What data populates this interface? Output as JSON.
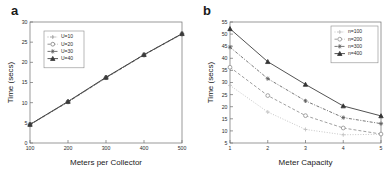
{
  "figure": {
    "panel_a_label": "a",
    "panel_b_label": "b"
  },
  "chart_data": [
    {
      "panel": "a",
      "type": "line",
      "title": "",
      "xlabel": "Meters per Collector",
      "ylabel": "Time (secs)",
      "x": [
        100,
        200,
        300,
        400,
        500
      ],
      "xticks": [
        "100",
        "200",
        "300",
        "400",
        "500"
      ],
      "yticks": [
        "0",
        "5",
        "10",
        "15",
        "20",
        "25",
        "30"
      ],
      "xlim": [
        100,
        500
      ],
      "ylim": [
        0,
        30
      ],
      "grid": false,
      "legend_position": "upper-left",
      "series": [
        {
          "name": "U=10",
          "values": [
            4.5,
            10.1,
            16.1,
            21.8,
            27.0
          ],
          "color": "#9b9b9b",
          "marker": "plus",
          "dash": "dotted"
        },
        {
          "name": "U=20",
          "values": [
            4.5,
            10.2,
            16.2,
            21.8,
            27.0
          ],
          "color": "#7d7d7d",
          "marker": "circle",
          "dash": "dashed"
        },
        {
          "name": "U=30",
          "values": [
            4.6,
            10.2,
            16.2,
            21.9,
            27.1
          ],
          "color": "#5a5a5a",
          "marker": "star",
          "dash": "dashdot"
        },
        {
          "name": "U=40",
          "values": [
            4.6,
            10.3,
            16.3,
            21.9,
            27.1
          ],
          "color": "#3a3a3a",
          "marker": "triangle",
          "dash": "solid"
        }
      ]
    },
    {
      "panel": "b",
      "type": "line",
      "title": "",
      "xlabel": "Meter Capacity",
      "ylabel": "Time (secs)",
      "x": [
        1,
        2,
        3,
        4,
        5
      ],
      "xticks": [
        "1",
        "2",
        "3",
        "4",
        "5"
      ],
      "yticks": [
        "5",
        "10",
        "15",
        "20",
        "25",
        "30",
        "35",
        "40",
        "45",
        "50",
        "55"
      ],
      "xlim": [
        1,
        5
      ],
      "ylim": [
        5,
        55
      ],
      "grid": false,
      "legend_position": "upper-right",
      "series": [
        {
          "name": "n=100",
          "values": [
            28.8,
            17.8,
            10.6,
            8.4,
            8.6
          ],
          "color": "#bdbdbd",
          "marker": "plus",
          "dash": "dotted"
        },
        {
          "name": "n=200",
          "values": [
            36.3,
            24.6,
            16.3,
            11.2,
            8.7
          ],
          "color": "#8f8f8f",
          "marker": "circle",
          "dash": "dashed"
        },
        {
          "name": "n=300",
          "values": [
            44.6,
            31.6,
            22.4,
            15.5,
            13.0
          ],
          "color": "#5e5e5e",
          "marker": "star",
          "dash": "dashdot"
        },
        {
          "name": "n=400",
          "values": [
            52.2,
            38.6,
            29.2,
            20.3,
            16.2
          ],
          "color": "#333333",
          "marker": "triangle",
          "dash": "solid"
        }
      ]
    }
  ]
}
